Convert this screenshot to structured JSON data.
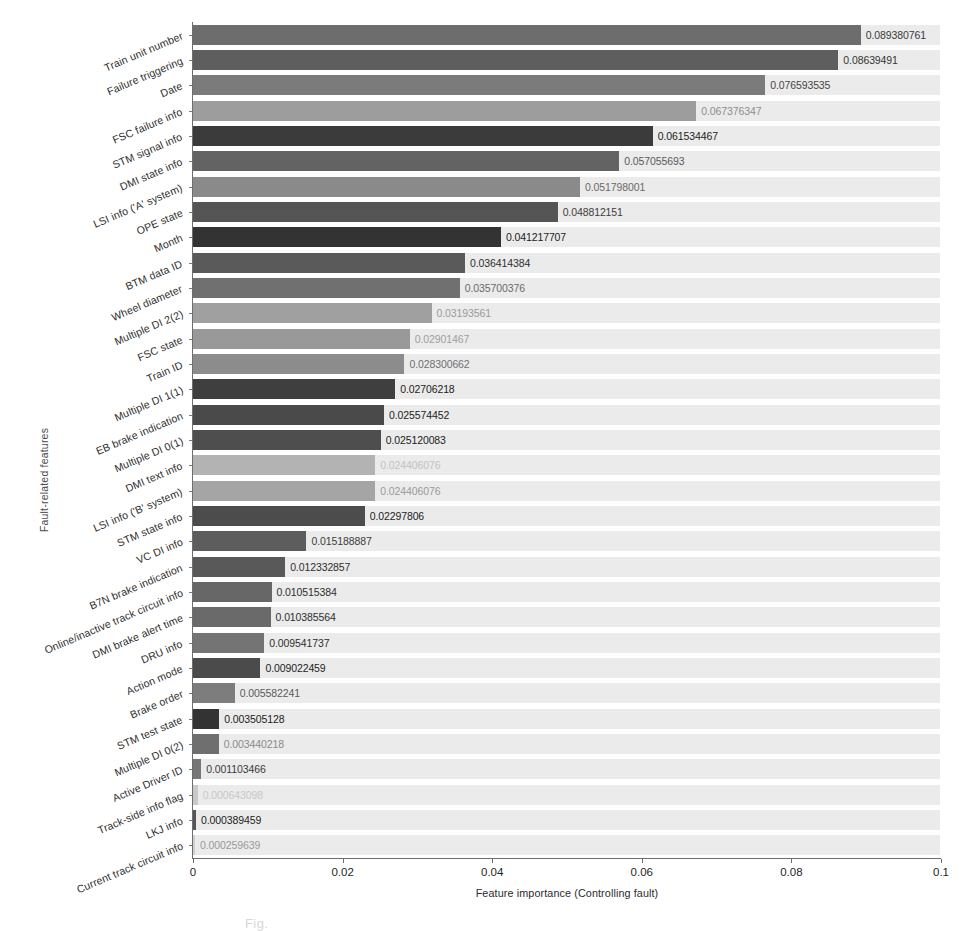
{
  "axes": {
    "y_title": "Fault-related features",
    "x_title": "Feature importance (Controlling fault)",
    "x_ticks": [
      "0",
      "0.02",
      "0.04",
      "0.06",
      "0.08",
      "0.1"
    ]
  },
  "caption_fragment": "Fig.",
  "chart_data": {
    "type": "bar",
    "orientation": "horizontal",
    "title": "",
    "xlabel": "Feature importance (Controlling fault)",
    "ylabel": "Fault-related features",
    "xlim": [
      0,
      0.1
    ],
    "grid": false,
    "legend": null,
    "categories": [
      "Train unit number",
      "Failure triggering",
      "Date",
      "FSC failure info",
      "STM signal info",
      "DMI state info",
      "LSI info ('A' system)",
      "OPE state",
      "Month",
      "BTM data ID",
      "Wheel diameter",
      "Multiple DI 2(2)",
      "FSC state",
      "Train ID",
      "Multiple DI 1(1)",
      "EB brake indication",
      "Multiple DI 0(1)",
      "DMI text info",
      "LSI info ('B' system)",
      "STM state info",
      "VC DI info",
      "B7N brake indication",
      "Online/inactive track circuit info",
      "DMI brake alert time",
      "DRU info",
      "Action mode",
      "Brake order",
      "STM test state",
      "Multiple DI 0(2)",
      "Active Driver ID",
      "Track-side info flag",
      "LKJ info",
      "Current track circuit info"
    ],
    "values": [
      0.089380761,
      0.08639491,
      0.076593535,
      0.067376347,
      0.061534467,
      0.057055693,
      0.051798001,
      0.048812151,
      0.041217707,
      0.036414384,
      0.035700376,
      0.03193561,
      0.02901467,
      0.028300662,
      0.02706218,
      0.025574452,
      0.025120083,
      0.024406076,
      0.024406076,
      0.02297806,
      0.015188887,
      0.012332857,
      0.010515384,
      0.010385564,
      0.009541737,
      0.009022459,
      0.005582241,
      0.003505128,
      0.003440218,
      0.001103466,
      0.000643098,
      0.000389459,
      0.000259639
    ],
    "value_labels": [
      "0.089380761",
      "0.08639491",
      "0.076593535",
      "0.067376347",
      "0.061534467",
      "0.057055693",
      "0.051798001",
      "0.048812151",
      "0.041217707",
      "0.036414384",
      "0.035700376",
      "0.03193561",
      "0.02901467",
      "0.028300662",
      "0.02706218",
      "0.025574452",
      "0.025120083",
      "0.024406076",
      "0.024406076",
      "0.02297806",
      "0.015188887",
      "0.012332857",
      "0.010515384",
      "0.010385564",
      "0.009541737",
      "0.009022459",
      "0.005582241",
      "0.003505128",
      "0.003440218",
      "0.001103466",
      "0.000643098",
      "0.000389459",
      "0.000259639"
    ],
    "bar_colors": [
      "#6d6d6d",
      "#5e5e5e",
      "#7b7b7b",
      "#9d9d9d",
      "#3b3b3b",
      "#636363",
      "#8a8a8a",
      "#555555",
      "#333333",
      "#5a5a5a",
      "#707070",
      "#a0a0a0",
      "#999999",
      "#8c8c8c",
      "#3f3f3f",
      "#4a4a4a",
      "#4e4e4e",
      "#b3b3b3",
      "#a5a5a5",
      "#4c4c4c",
      "#5d5d5d",
      "#595959",
      "#676767",
      "#6a6a6a",
      "#747474",
      "#4b4b4b",
      "#7d7d7d",
      "#333333",
      "#6f6f6f",
      "#777777",
      "#c9c9c9",
      "#555555",
      "#d0d0d0"
    ],
    "value_label_colors": [
      "#3a3a3a",
      "#343434",
      "#454545",
      "#8d8d8d",
      "#1c1c1c",
      "#5a5a5a",
      "#6a6a6a",
      "#3c3c3c",
      "#1c1c1c",
      "#2e2e2e",
      "#6a6a6a",
      "#9a9a9a",
      "#9e9e9e",
      "#6f6f6f",
      "#1c1c1c",
      "#1c1c1c",
      "#1c1c1c",
      "#c2c2c2",
      "#9a9a9a",
      "#1c1c1c",
      "#3c3c3c",
      "#2e2e2e",
      "#2e2e2e",
      "#2e2e2e",
      "#2e2e2e",
      "#1c1c1c",
      "#5a5a5a",
      "#1c1c1c",
      "#8a8a8a",
      "#3a3a3a",
      "#c8c8c8",
      "#1c1c1c",
      "#9a9a9a"
    ]
  }
}
